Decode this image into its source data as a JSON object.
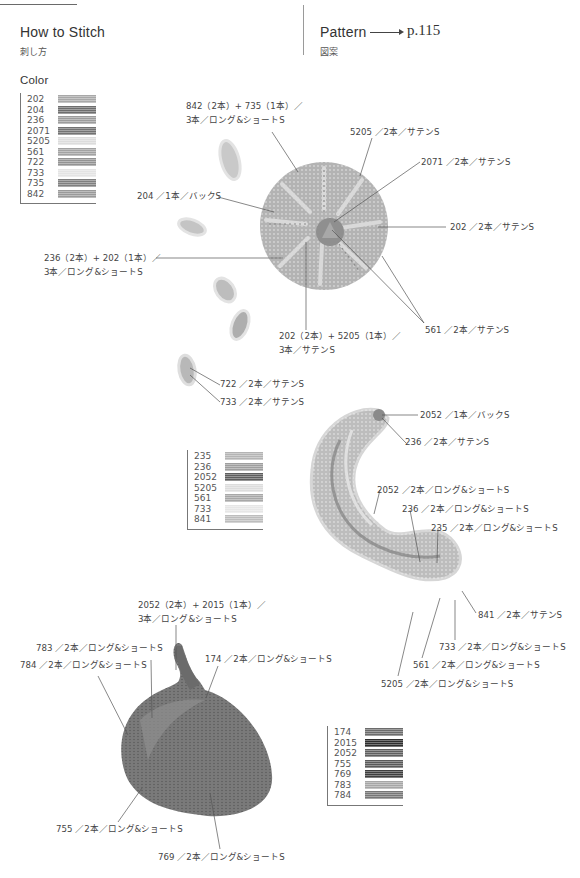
{
  "header": {
    "left_title": "How to Stitch",
    "left_subtitle": "刺し方",
    "right_title": "Pattern",
    "right_pageref": "p.115",
    "right_subtitle": "図案"
  },
  "color_heading": "Color",
  "legends": [
    {
      "id": "flower",
      "items": [
        {
          "code": "202",
          "color": "#a8a8a8"
        },
        {
          "code": "204",
          "color": "#6e6e6e"
        },
        {
          "code": "236",
          "color": "#9c9c9c"
        },
        {
          "code": "2071",
          "color": "#727272"
        },
        {
          "code": "5205",
          "color": "#dcdcdc"
        },
        {
          "code": "561",
          "color": "#a2a2a2"
        },
        {
          "code": "722",
          "color": "#939393"
        },
        {
          "code": "733",
          "color": "#e4e4e4"
        },
        {
          "code": "735",
          "color": "#808080"
        },
        {
          "code": "842",
          "color": "#9a9a9a"
        }
      ]
    },
    {
      "id": "tail",
      "items": [
        {
          "code": "235",
          "color": "#b4b4b4"
        },
        {
          "code": "236",
          "color": "#9e9e9e"
        },
        {
          "code": "2052",
          "color": "#5e5e5e"
        },
        {
          "code": "5205",
          "color": "#dddddd"
        },
        {
          "code": "561",
          "color": "#a8a8a8"
        },
        {
          "code": "733",
          "color": "#e6e6e6"
        },
        {
          "code": "841",
          "color": "#bdbdbd"
        }
      ]
    },
    {
      "id": "onion",
      "items": [
        {
          "code": "174",
          "color": "#6c6c6c"
        },
        {
          "code": "2015",
          "color": "#2e2e2e"
        },
        {
          "code": "2052",
          "color": "#5f5f5f"
        },
        {
          "code": "755",
          "color": "#5a5a5a"
        },
        {
          "code": "769",
          "color": "#3e3e3e"
        },
        {
          "code": "783",
          "color": "#a6a6a6"
        },
        {
          "code": "784",
          "color": "#777777"
        }
      ]
    }
  ],
  "annotations": {
    "flower": {
      "a842_line1": "842（2本）+ 735（1本）／",
      "a842_line2": "3本／ロング&ショートS",
      "a5205": "5205 ／2本／サテンS",
      "a2071": "2071 ／2本／サテンS",
      "a204": "204 ／1本／バックS",
      "a202": "202 ／2本／サテンS",
      "a236_line1": "236（2本）+ 202（1本）／",
      "a236_line2": "3本／ロング&ショートS",
      "a561": "561 ／2本／サテンS",
      "a202b_line1": "202（2本）+ 5205（1本）／",
      "a202b_line2": "3本／サテンS",
      "a722": "722 ／2本／サテンS",
      "a733": "733 ／2本／サテンS"
    },
    "tail": {
      "a2052back": "2052 ／1本／バックS",
      "a236satin": "236 ／2本／サテンS",
      "a2052ls": "2052 ／2本／ロング&ショートS",
      "a236ls": "236 ／2本／ロング&ショートS",
      "a235ls": "235 ／2本／ロング&ショートS",
      "a841": "841 ／2本／サテンS",
      "a733ls": "733 ／2本／ロング&ショートS",
      "a561ls": "561 ／2本／ロング&ショートS",
      "a5205ls": "5205 ／2本／ロング&ショートS"
    },
    "onion": {
      "a2052_line1": "2052（2本）+ 2015（1本）／",
      "a2052_line2": "3本／ロング&ショートS",
      "a783": "783 ／2本／ロング&ショートS",
      "a784": "784 ／2本／ロング&ショートS",
      "a174": "174 ／2本／ロング&ショートS",
      "a755": "755 ／2本／ロング&ショートS",
      "a769": "769 ／2本／ロング&ショートS"
    }
  }
}
